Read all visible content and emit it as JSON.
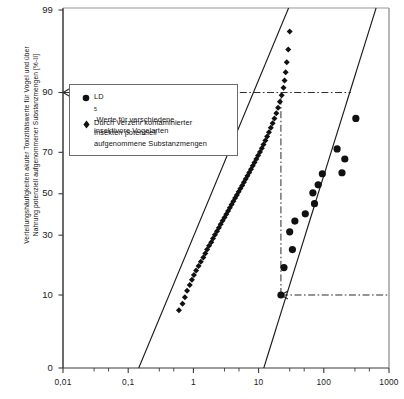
{
  "chart_data": {
    "type": "scatter",
    "title": "",
    "xlabel": "",
    "ylabel_lines": [
      "Verteilungshäufigkeiten akuter Toxizitätswerte für Vogel und über",
      "Nahrung potenziell aufgenommener Substanzmengen [%-II]"
    ],
    "x_scale": "log",
    "y_scale": "probability",
    "xlim": [
      0.01,
      1000
    ],
    "ylim": [
      0,
      99
    ],
    "xticks": [
      "0,01",
      "0,1",
      "1",
      "10",
      "100",
      "1000"
    ],
    "xtick_values": [
      0.01,
      0.1,
      1,
      10,
      100,
      1000
    ],
    "yticks": [
      "0",
      "10",
      "30",
      "50",
      "70",
      "90",
      "99"
    ],
    "ytick_values": [
      0,
      10,
      30,
      50,
      70,
      90,
      99
    ],
    "grid": false,
    "legend_position": "upper-left-inside",
    "series": [
      {
        "name": "Durch Verzehr kontaminierter Insekten potenziell aufgenommene Substanzmengen",
        "marker": "diamond",
        "color": "#111111",
        "fit_line": {
          "x1": 0.145,
          "y1": 0,
          "x2": 28.0,
          "y2": 99
        },
        "points": [
          {
            "x": 0.6,
            "y": 7.0
          },
          {
            "x": 0.68,
            "y": 8.2
          },
          {
            "x": 0.74,
            "y": 9.5
          },
          {
            "x": 0.8,
            "y": 11.0
          },
          {
            "x": 0.88,
            "y": 12.4
          },
          {
            "x": 0.95,
            "y": 13.8
          },
          {
            "x": 1.02,
            "y": 15.2
          },
          {
            "x": 1.1,
            "y": 16.6
          },
          {
            "x": 1.2,
            "y": 18.0
          },
          {
            "x": 1.3,
            "y": 19.5
          },
          {
            "x": 1.42,
            "y": 21.0
          },
          {
            "x": 1.52,
            "y": 22.5
          },
          {
            "x": 1.62,
            "y": 24.0
          },
          {
            "x": 1.74,
            "y": 25.5
          },
          {
            "x": 1.88,
            "y": 27.0
          },
          {
            "x": 2.0,
            "y": 28.6
          },
          {
            "x": 2.14,
            "y": 30.2
          },
          {
            "x": 2.3,
            "y": 31.8
          },
          {
            "x": 2.46,
            "y": 33.4
          },
          {
            "x": 2.62,
            "y": 35.0
          },
          {
            "x": 2.8,
            "y": 36.6
          },
          {
            "x": 3.0,
            "y": 38.2
          },
          {
            "x": 3.2,
            "y": 39.8
          },
          {
            "x": 3.4,
            "y": 41.4
          },
          {
            "x": 3.62,
            "y": 43.0
          },
          {
            "x": 3.86,
            "y": 44.6
          },
          {
            "x": 4.1,
            "y": 46.2
          },
          {
            "x": 4.36,
            "y": 47.8
          },
          {
            "x": 4.64,
            "y": 49.4
          },
          {
            "x": 4.94,
            "y": 51.0
          },
          {
            "x": 5.26,
            "y": 52.6
          },
          {
            "x": 5.6,
            "y": 54.2
          },
          {
            "x": 5.96,
            "y": 55.8
          },
          {
            "x": 6.34,
            "y": 57.4
          },
          {
            "x": 6.75,
            "y": 59.0
          },
          {
            "x": 7.18,
            "y": 60.6
          },
          {
            "x": 7.64,
            "y": 62.2
          },
          {
            "x": 8.14,
            "y": 63.8
          },
          {
            "x": 8.66,
            "y": 65.4
          },
          {
            "x": 9.22,
            "y": 67.0
          },
          {
            "x": 9.82,
            "y": 68.6
          },
          {
            "x": 10.5,
            "y": 70.2
          },
          {
            "x": 11.2,
            "y": 71.8
          },
          {
            "x": 11.9,
            "y": 73.4
          },
          {
            "x": 12.7,
            "y": 75.0
          },
          {
            "x": 13.5,
            "y": 76.6
          },
          {
            "x": 14.4,
            "y": 78.2
          },
          {
            "x": 15.4,
            "y": 79.8
          },
          {
            "x": 16.4,
            "y": 81.4
          },
          {
            "x": 17.5,
            "y": 83.0
          },
          {
            "x": 18.7,
            "y": 84.6
          },
          {
            "x": 19.9,
            "y": 86.2
          },
          {
            "x": 21.2,
            "y": 87.8
          },
          {
            "x": 22.6,
            "y": 89.4
          },
          {
            "x": 24.1,
            "y": 91.0
          },
          {
            "x": 25.0,
            "y": 92.4
          },
          {
            "x": 26.0,
            "y": 93.8
          },
          {
            "x": 27.0,
            "y": 95.2
          },
          {
            "x": 28.5,
            "y": 96.6
          },
          {
            "x": 30.0,
            "y": 98.0
          }
        ]
      },
      {
        "name": "LD50-Werte für verschiedene insektivore Vogelarten",
        "marker": "circle",
        "color": "#111111",
        "fit_line": {
          "x1": 12.0,
          "y1": 0,
          "x2": 620.0,
          "y2": 99
        },
        "points": [
          {
            "x": 22.0,
            "y": 10.0
          },
          {
            "x": 24.5,
            "y": 17.5
          },
          {
            "x": 33.0,
            "y": 24.0
          },
          {
            "x": 30.0,
            "y": 31.5
          },
          {
            "x": 36.0,
            "y": 36.5
          },
          {
            "x": 52.0,
            "y": 40.0
          },
          {
            "x": 72.0,
            "y": 45.0
          },
          {
            "x": 68.0,
            "y": 50.5
          },
          {
            "x": 82.0,
            "y": 54.5
          },
          {
            "x": 95.0,
            "y": 60.0
          },
          {
            "x": 190.0,
            "y": 60.5
          },
          {
            "x": 210.0,
            "y": 67.0
          },
          {
            "x": 160.0,
            "y": 71.5
          },
          {
            "x": 310.0,
            "y": 83.0
          }
        ]
      }
    ],
    "reference_lines": [
      {
        "name": "ref-90-horizontal",
        "type": "horizontal",
        "y": 90,
        "x_from": 0.01,
        "x_to": 260.0,
        "style": "dash-dot",
        "arrow": "left"
      },
      {
        "name": "ref-10-horizontal",
        "type": "horizontal",
        "y": 10,
        "x_from": 22.0,
        "x_to": 1000.0,
        "style": "dash-dot",
        "arrow": "left"
      },
      {
        "name": "ref-vertical-connector",
        "type": "vertical",
        "x": 22.0,
        "y_from": 10,
        "y_to": 90,
        "style": "dash-dot",
        "arrow": "none"
      }
    ]
  },
  "legend": {
    "items": [
      {
        "marker": "circle",
        "marker_name": "filled-circle-marker",
        "line1_pre": "LD",
        "line1_sub": "5",
        "line1_post": "-Werte für verschiedene",
        "line2": "insektivore Vogelarten"
      },
      {
        "marker": "diamond",
        "marker_name": "filled-diamond-marker",
        "line1": "Durch  Verzehr kontaminierter",
        "line2": "Insekten potenziell",
        "line3": "aufgenommene Substanzmengen"
      }
    ]
  },
  "axes": {
    "y_title_line1": "Verteilungshäufigkeiten akuter Toxizitätswerte für Vogel und über",
    "y_title_line2": "Nahrung potenziell aufgenommener Substanzmengen [%-II]",
    "ylabels": [
      "99",
      "90",
      "70",
      "50",
      "30",
      "10",
      "0"
    ],
    "xlabels": [
      "0,01",
      "0,1",
      "1",
      "10",
      "100",
      "1000"
    ]
  },
  "colors": {
    "axis": "#3a3a3a",
    "marker": "#111111",
    "fit_line": "#1a1a1a",
    "reference": "#2b2b2b",
    "legend_border": "#6b6b6b",
    "background": "#ffffff"
  }
}
